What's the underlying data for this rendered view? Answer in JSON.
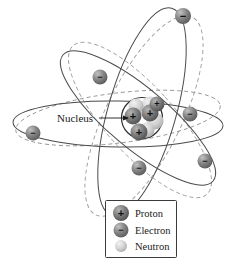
{
  "figure": {
    "type": "atom-diagram",
    "title": "",
    "background_color": "#ffffff"
  },
  "annotations": {
    "nucleus_label": "Nucleus"
  },
  "legend": {
    "items": [
      {
        "label": "Proton",
        "symbol": "+",
        "color": "#6e6e6e"
      },
      {
        "label": "Electron",
        "symbol": "−",
        "color": "#7d7d7d"
      },
      {
        "label": "Neutron",
        "symbol": "",
        "color": "#c9c9c9"
      }
    ],
    "border_color": "#3a3a3a"
  },
  "nucleus": {
    "center_x": 142,
    "center_y": 118,
    "radius": 20,
    "protons": 4,
    "neutrons": 4,
    "proton_color": "#6e6e6e",
    "neutron_color": "#c9c9c9",
    "outline_color": "#2b2b2b"
  },
  "orbits": [
    {
      "name": "horizontal-solid-orbit",
      "style": "solid",
      "rx": 68,
      "ry": 19,
      "rotation": -4,
      "color": "#4a4a4a"
    },
    {
      "name": "horizontal-dashed-orbit",
      "style": "dashed",
      "rx": 68,
      "ry": 19,
      "rotation": -14,
      "color": "#8a8a8a"
    },
    {
      "name": "steep-solid-orbit",
      "style": "solid",
      "rx": 26,
      "ry": 93,
      "rotation": 22,
      "color": "#4a4a4a"
    },
    {
      "name": "steep-dashed-orbit",
      "style": "dashed",
      "rx": 26,
      "ry": 93,
      "rotation": 34,
      "color": "#8a8a8a"
    },
    {
      "name": "diagonal-solid-orbit",
      "style": "solid",
      "rx": 30,
      "ry": 86,
      "rotation": -48,
      "color": "#4a4a4a"
    },
    {
      "name": "diagonal-dashed-orbit",
      "style": "dashed",
      "rx": 30,
      "ry": 86,
      "rotation": -40,
      "color": "#8a8a8a"
    }
  ],
  "electrons": [
    {
      "name": "electron-top",
      "x": 183,
      "y": 16,
      "r": 8
    },
    {
      "name": "electron-upper-left",
      "x": 100,
      "y": 77,
      "r": 7.5
    },
    {
      "name": "electron-left",
      "x": 33,
      "y": 133,
      "r": 7.5
    },
    {
      "name": "electron-right-upper",
      "x": 190,
      "y": 114,
      "r": 7.5
    },
    {
      "name": "electron-bottom-center",
      "x": 139,
      "y": 168,
      "r": 7.5
    },
    {
      "name": "electron-right-lower",
      "x": 205,
      "y": 161,
      "r": 7.5
    }
  ],
  "colors": {
    "electron": "#7d7d7d",
    "proton": "#6e6e6e",
    "neutron": "#c9c9c9",
    "stroke_dark": "#2b2b2b",
    "stroke_mid": "#4a4a4a",
    "stroke_light": "#8a8a8a"
  }
}
